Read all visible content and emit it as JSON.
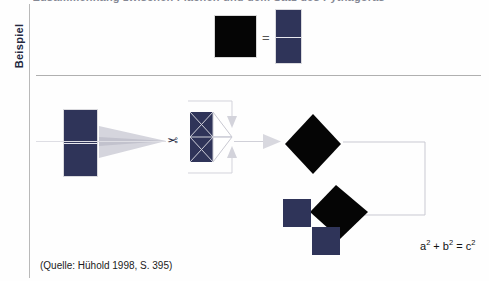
{
  "page": {
    "background_color": "#fefefe",
    "navy_color": "#2f3459",
    "black_color": "#050505",
    "rule_color": "#b0b0b0",
    "arrow_gray": "#c9c9d2"
  },
  "header": {
    "cut_off_heading": "Zusammenhang zwischen Flächen und dem Satz des Pythagoras"
  },
  "sidebar": {
    "label": "Beispiel"
  },
  "row_top": {
    "black_square_name": "black-square",
    "equals_sign": "=",
    "navy_rectangle_name": "navy-split-rectangle"
  },
  "row_middle": {
    "left_rectangle_name": "navy-split-rectangle-left",
    "scissors_icon": "✂",
    "triangle_square_name": "navy-triangle-square",
    "diamond_name": "black-diamond"
  },
  "row_bottom": {
    "diamond_name": "black-diamond-c2",
    "square_a_name": "navy-square-a2",
    "square_b_name": "navy-square-b2"
  },
  "formula": {
    "text": "a² + b² = c²",
    "a_base": "a",
    "a_exp": "2",
    "plus": "+",
    "b_base": "b",
    "b_exp": "2",
    "equals": "=",
    "c_base": "c",
    "c_exp": "2"
  },
  "caption": {
    "source": "(Quelle: Hühold 1998, S. 395)"
  }
}
